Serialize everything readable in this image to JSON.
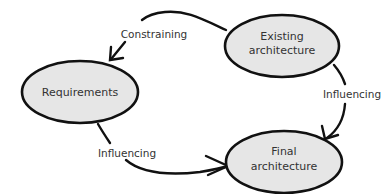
{
  "diagram": {
    "nodes": [
      {
        "id": "requirements",
        "lines": [
          "Requirements"
        ]
      },
      {
        "id": "existing",
        "lines": [
          "Existing",
          "architecture"
        ]
      },
      {
        "id": "final",
        "lines": [
          "Final",
          "architecture"
        ]
      }
    ],
    "edges": [
      {
        "from": "existing",
        "to": "requirements",
        "label": "Constraining"
      },
      {
        "from": "existing",
        "to": "final",
        "label": "Influencing"
      },
      {
        "from": "requirements",
        "to": "final",
        "label": "Influencing"
      }
    ]
  }
}
